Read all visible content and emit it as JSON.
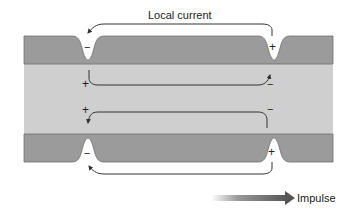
{
  "title": "Local current",
  "impulse_label": "Impulse",
  "colors": {
    "membrane": "#9b9b9b",
    "membrane_edge": "#6e6e6e",
    "axoplasm": "#cfcfcf",
    "arrow": "#333333",
    "impulse_arrow": "#555555",
    "background": "#ffffff"
  },
  "charges": {
    "top_membrane_left": "−",
    "top_membrane_right": "+",
    "inner_top_left": "+",
    "inner_top_right": "−",
    "inner_bottom_left": "+",
    "inner_bottom_right": "−",
    "bottom_membrane_left": "−",
    "bottom_membrane_right": "+"
  }
}
